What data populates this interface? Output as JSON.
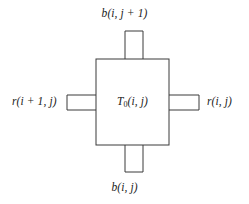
{
  "figure": {
    "type": "block-diagram",
    "background_color": "#ffffff",
    "stroke_color": "#3a3a3a",
    "text_color": "#1a1a1a",
    "canvas": {
      "width": 249,
      "height": 204
    }
  },
  "center_block": {
    "label_prefix": "T",
    "label_subscript": "0",
    "label_suffix": "(i, j)",
    "label_full": "T0(i, j)",
    "x": 96,
    "y": 59,
    "width": 73,
    "height": 86
  },
  "ports": {
    "top": {
      "label": "b(i, j + 1)",
      "x": 125,
      "y": 31,
      "width": 18,
      "height": 29
    },
    "bottom": {
      "label": "b(i, j)",
      "x": 125,
      "y": 145,
      "width": 18,
      "height": 27
    },
    "left": {
      "label": "r(i + 1, j)",
      "x": 67,
      "y": 95,
      "width": 30,
      "height": 15
    },
    "right": {
      "label": "r(i, j)",
      "x": 168,
      "y": 95,
      "width": 31,
      "height": 15
    }
  }
}
